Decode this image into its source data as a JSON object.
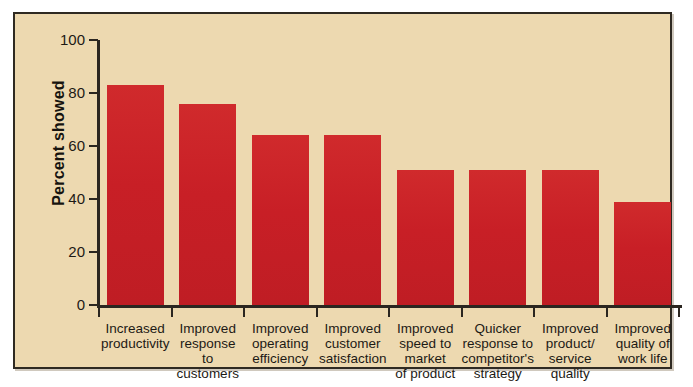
{
  "figure": {
    "background_color": "#ffffff",
    "panel_color": "#edd9b0",
    "panel_border_color": "#2f2a22",
    "bar_color": "#cc2027",
    "text_color": "#1d1a15"
  },
  "chart_data": {
    "type": "bar",
    "title": "",
    "xlabel": "",
    "ylabel": "Percent showed",
    "ylim": [
      0,
      100
    ],
    "yticks": [
      0,
      20,
      40,
      60,
      80,
      100
    ],
    "ytick_labels": [
      "0",
      "20",
      "40",
      "60",
      "80",
      "100"
    ],
    "grid": false,
    "legend": null,
    "bar_color": "#cc2027",
    "categories": [
      "Increased productivity",
      "Improved response to customers",
      "Improved operating efficiency",
      "Improved customer satisfaction",
      "Improved speed to market of product",
      "Quicker response to competitor's strategy",
      "Improved product/ service quality",
      "Improved quality of work life"
    ],
    "category_lines": [
      [
        "Increased",
        "productivity"
      ],
      [
        "Improved",
        "response",
        "to",
        "customers"
      ],
      [
        "Improved",
        "operating",
        "efficiency"
      ],
      [
        "Improved",
        "customer",
        "satisfaction"
      ],
      [
        "Improved",
        "speed to",
        "market",
        "of product"
      ],
      [
        "Quicker",
        "response to",
        "competitor's",
        "strategy"
      ],
      [
        "Improved",
        "product/",
        "service",
        "quality"
      ],
      [
        "Improved",
        "quality of",
        "work life"
      ]
    ],
    "values": [
      83,
      76,
      64,
      64,
      51,
      51,
      51,
      39
    ]
  }
}
